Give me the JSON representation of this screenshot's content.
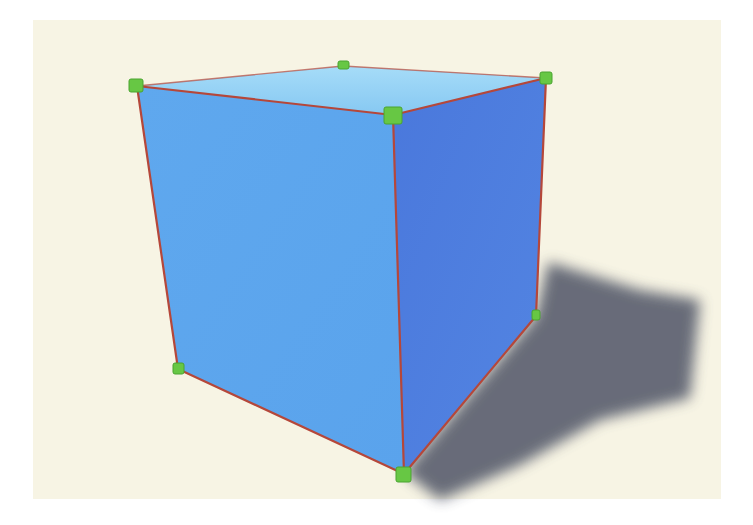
{
  "scene": {
    "subject": "cube",
    "background_color": "#f7f4e4",
    "colors": {
      "top_face": "#8fd0f5",
      "front_face": "#5ea6ee",
      "right_face": "#4f7fe0",
      "edge": "#b5473a",
      "vertex_handle": "#67c744",
      "shadow": "#5b6170"
    },
    "vertex_count": 8,
    "visible_vertex_handles": 7
  }
}
